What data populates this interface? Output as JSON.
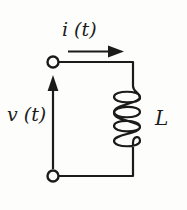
{
  "figure": {
    "background_color": "#fdfdfb",
    "ink_color": "#1b1b1b"
  },
  "labels": {
    "current": "i (t)",
    "voltage": "v (t)",
    "inductance": "L"
  },
  "terminals": [
    {
      "name": "top-terminal",
      "cx": 53,
      "cy": 62,
      "r": 5.5
    },
    {
      "name": "bottom-terminal",
      "cx": 53,
      "cy": 176,
      "r": 5.5
    }
  ],
  "arrows": {
    "current": {
      "label": "i (t)",
      "direction": "right",
      "x1": 68,
      "y1": 52,
      "x2": 122,
      "y2": 52
    },
    "voltage": {
      "label": "v (t)",
      "direction": "up",
      "x1": 53,
      "y1": 168,
      "x2": 53,
      "y2": 78
    }
  },
  "component": {
    "type": "inductor",
    "symbol_name": "coil-inductor",
    "loops": 4,
    "orientation": "vertical",
    "label": "L"
  }
}
